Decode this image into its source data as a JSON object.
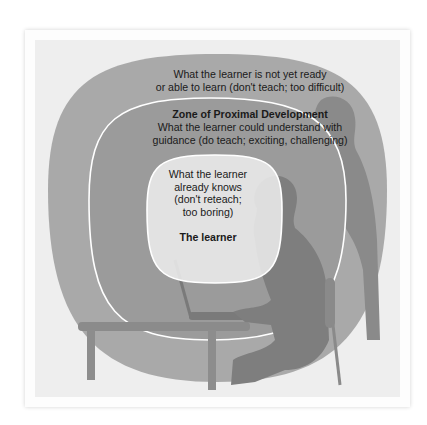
{
  "diagram": {
    "type": "concentric-zones",
    "zones": [
      {
        "id": "outer",
        "lines": [
          "What the learner is not yet ready",
          "or able to learn (don't teach; too difficult)"
        ]
      },
      {
        "id": "zpd",
        "title": "Zone of Proximal Development",
        "lines": [
          "What the learner could understand with",
          "guidance (do teach; exciting, challenging)"
        ]
      },
      {
        "id": "inner",
        "lines": [
          "What the learner",
          "already knows",
          "(don't reteach;",
          "too boring)"
        ],
        "title": "The learner"
      }
    ],
    "illustration": "silhouette of a learner seated at a desk with a laptop, teacher standing behind",
    "colors": {
      "outer_zone": "#a9a9a9",
      "zpd_zone": "#9b9b9b",
      "inner_zone": "#e8e8e8",
      "silhouette_dark": "#7e7e7e",
      "outline": "#ffffff"
    }
  }
}
